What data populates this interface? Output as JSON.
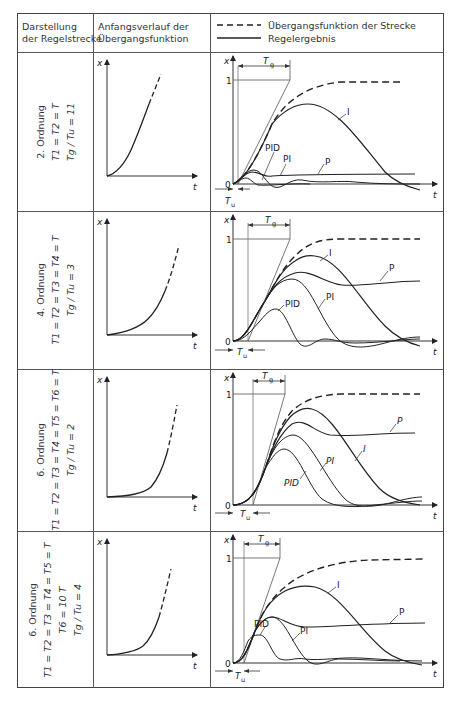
{
  "header": {
    "col1_line1": "Darstellung",
    "col1_line2": "der Regelstrecke",
    "col2_line1": "Anfangsverlauf der",
    "col2_line2": "Übergangsfunktion",
    "legend_dashed": "Übergangsfunktion der Strecke",
    "legend_solid": "Regelergebnis"
  },
  "axis": {
    "x": "x",
    "t": "t",
    "one": "1",
    "zero": "0",
    "Tg": "T",
    "Tg_sub": "g",
    "Tu": "T",
    "Tu_sub": "u"
  },
  "rows": [
    {
      "order": "2. Ordnung",
      "eq1": "T1 = T2 = T",
      "eq2": "",
      "ratio": "Tg / Tu = 11",
      "labels": {
        "I": "I",
        "P": "P",
        "PI": "PI",
        "PID": "PID"
      }
    },
    {
      "order": "4. Ordnung",
      "eq1": "T1 = T2 = T3 = T4 = T",
      "eq2": "",
      "ratio": "Tg / Tu = 3",
      "labels": {
        "I": "I",
        "P": "P",
        "PI": "PI",
        "PID": "PID"
      }
    },
    {
      "order": "6. Ordnung",
      "eq1": "T1 = T2 = T3 = T4 = T5 = T6 = T",
      "eq2": "",
      "ratio": "Tg / Tu = 2",
      "labels": {
        "I": "I",
        "P": "P",
        "PI": "PI",
        "PID": "PID"
      }
    },
    {
      "order": "6. Ordnung",
      "eq1": "T1 = T2 = T3 = T4 = T5 = T",
      "eq2": "T6 = 10 T",
      "ratio": "Tg / Tu = 4",
      "labels": {
        "I": "I",
        "P": "P",
        "PI": "PI",
        "PID": "PID"
      }
    }
  ]
}
